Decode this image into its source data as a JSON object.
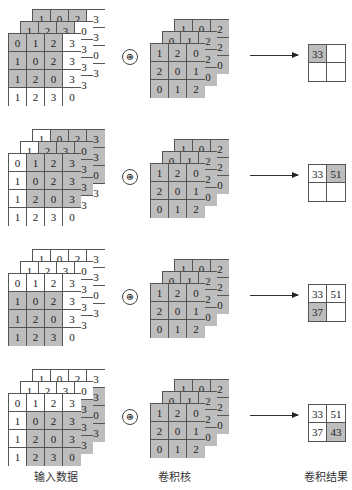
{
  "labels": {
    "input": "输入数据",
    "kernel": "卷积核",
    "result": "卷积结果"
  },
  "operator_symbol": "⊛",
  "colors": {
    "highlight": "#bdbdbd",
    "grid_line": "#555555"
  },
  "input": {
    "layer_back": [
      [
        1,
        0,
        2,
        3
      ],
      [
        null,
        null,
        null,
        3
      ],
      [
        null,
        null,
        null,
        0
      ],
      [
        null,
        null,
        null,
        3
      ]
    ],
    "layer_middle": [
      [
        1,
        2,
        3,
        0
      ],
      [
        null,
        null,
        null,
        3
      ],
      [
        null,
        null,
        null,
        3
      ],
      [
        null,
        null,
        null,
        3
      ]
    ],
    "layer_front": [
      [
        0,
        1,
        2,
        3
      ],
      [
        1,
        0,
        2,
        3
      ],
      [
        1,
        2,
        0,
        3
      ],
      [
        1,
        2,
        3,
        0
      ]
    ]
  },
  "kernel": {
    "layer_back": [
      [
        1,
        0,
        2
      ],
      [
        null,
        null,
        2
      ],
      [
        null,
        null,
        0
      ]
    ],
    "layer_middle": [
      [
        0,
        1,
        2
      ],
      [
        null,
        null,
        2
      ],
      [
        null,
        null,
        0
      ]
    ],
    "layer_front": [
      [
        1,
        2,
        0
      ],
      [
        2,
        0,
        1
      ],
      [
        0,
        1,
        2
      ]
    ]
  },
  "steps": [
    {
      "window_row": 0,
      "window_col": 0,
      "result": [
        [
          "33",
          ""
        ],
        [
          "",
          ""
        ]
      ],
      "highlight": [
        0,
        0
      ]
    },
    {
      "window_row": 0,
      "window_col": 1,
      "result": [
        [
          "33",
          "51"
        ],
        [
          "",
          ""
        ]
      ],
      "highlight": [
        0,
        1
      ]
    },
    {
      "window_row": 1,
      "window_col": 0,
      "result": [
        [
          "33",
          "51"
        ],
        [
          "37",
          ""
        ]
      ],
      "highlight": [
        1,
        0
      ]
    },
    {
      "window_row": 1,
      "window_col": 1,
      "result": [
        [
          "33",
          "51"
        ],
        [
          "37",
          "43"
        ]
      ],
      "highlight": [
        1,
        1
      ]
    }
  ]
}
